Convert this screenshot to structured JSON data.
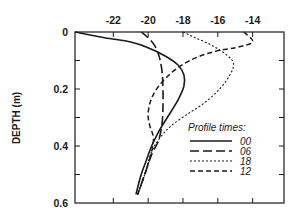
{
  "chart_data": {
    "type": "line",
    "title": "",
    "xlabel": "",
    "ylabel": "DEPTH (m)",
    "x_axis_position": "top",
    "y_axis_inverted": true,
    "xlim": [
      -24.2,
      -12.2
    ],
    "ylim": [
      0,
      0.6
    ],
    "x_ticks": [
      -22,
      -20,
      -18,
      -16,
      -14
    ],
    "x_tick_labels": [
      "-22",
      "-20",
      "-18",
      "-16",
      "-14"
    ],
    "y_ticks": [
      0,
      0.1,
      0.2,
      0.3,
      0.4,
      0.5,
      0.6
    ],
    "y_tick_labels": [
      "0",
      "",
      "0.2",
      "",
      "0.4",
      "",
      "0.6"
    ],
    "grid": false,
    "legend": {
      "title": "Profile times:",
      "position": "lower right",
      "entries": [
        "00",
        "06",
        "18",
        "12"
      ]
    },
    "series": [
      {
        "name": "00",
        "style": "solid",
        "points": [
          [
            -24.2,
            0.0
          ],
          [
            -22.5,
            0.02
          ],
          [
            -21.0,
            0.035
          ],
          [
            -20.0,
            0.055
          ],
          [
            -19.0,
            0.085
          ],
          [
            -18.3,
            0.115
          ],
          [
            -17.95,
            0.15
          ],
          [
            -17.95,
            0.19
          ],
          [
            -18.3,
            0.24
          ],
          [
            -18.9,
            0.3
          ],
          [
            -19.4,
            0.35
          ],
          [
            -19.8,
            0.4
          ],
          [
            -20.1,
            0.45
          ],
          [
            -20.4,
            0.5
          ],
          [
            -20.7,
            0.57
          ]
        ]
      },
      {
        "name": "06",
        "style": "long-dash",
        "points": [
          [
            -20.4,
            0.0
          ],
          [
            -20.0,
            0.02
          ],
          [
            -19.6,
            0.05
          ],
          [
            -19.35,
            0.09
          ],
          [
            -19.2,
            0.14
          ],
          [
            -19.15,
            0.2
          ],
          [
            -19.15,
            0.26
          ],
          [
            -19.2,
            0.32
          ],
          [
            -19.4,
            0.38
          ],
          [
            -19.8,
            0.43
          ],
          [
            -20.2,
            0.5
          ],
          [
            -20.6,
            0.57
          ]
        ]
      },
      {
        "name": "18",
        "style": "dotted",
        "points": [
          [
            -18.0,
            0.0
          ],
          [
            -17.3,
            0.02
          ],
          [
            -16.4,
            0.045
          ],
          [
            -15.5,
            0.08
          ],
          [
            -15.1,
            0.11
          ],
          [
            -15.3,
            0.15
          ],
          [
            -15.9,
            0.2
          ],
          [
            -16.8,
            0.25
          ],
          [
            -17.8,
            0.29
          ],
          [
            -18.7,
            0.33
          ],
          [
            -19.3,
            0.37
          ],
          [
            -19.8,
            0.42
          ],
          [
            -20.2,
            0.5
          ],
          [
            -20.6,
            0.57
          ]
        ]
      },
      {
        "name": "12",
        "style": "dashed",
        "points": [
          [
            -14.5,
            0.0
          ],
          [
            -14.0,
            0.035
          ],
          [
            -15.0,
            0.055
          ],
          [
            -16.3,
            0.07
          ],
          [
            -17.6,
            0.1
          ],
          [
            -18.6,
            0.14
          ],
          [
            -19.4,
            0.19
          ],
          [
            -19.85,
            0.24
          ],
          [
            -20.0,
            0.29
          ],
          [
            -19.9,
            0.33
          ],
          [
            -19.7,
            0.37
          ],
          [
            -19.8,
            0.42
          ],
          [
            -20.2,
            0.5
          ],
          [
            -20.6,
            0.57
          ]
        ]
      }
    ]
  }
}
